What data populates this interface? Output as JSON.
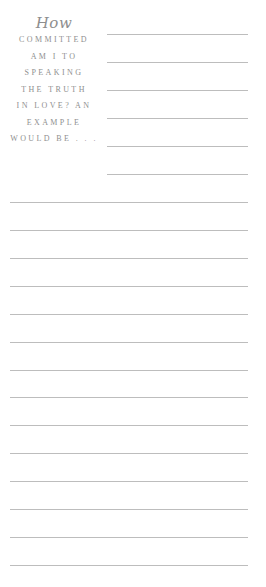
{
  "prompt": {
    "script_word": "How",
    "lines": [
      "COMMITTED",
      "AM I TO",
      "SPEAKING",
      "THE TRUTH",
      "IN LOVE? AN",
      "EXAMPLE",
      "WOULD BE . . ."
    ]
  },
  "colors": {
    "text": "#8f8f8f",
    "rule": "#bdbdbd",
    "background": "#ffffff"
  },
  "writing_lines": {
    "short_count": 6,
    "full_count": 14
  }
}
